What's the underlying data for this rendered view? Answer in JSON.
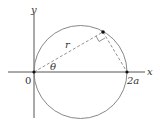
{
  "diagram": {
    "labels": {
      "y_axis": "y",
      "x_axis": "x",
      "origin": "0",
      "theta": "θ",
      "r": "r",
      "two_a": "2a"
    },
    "colors": {
      "stroke": "#777777",
      "axis": "#555555",
      "point": "#111111"
    }
  }
}
